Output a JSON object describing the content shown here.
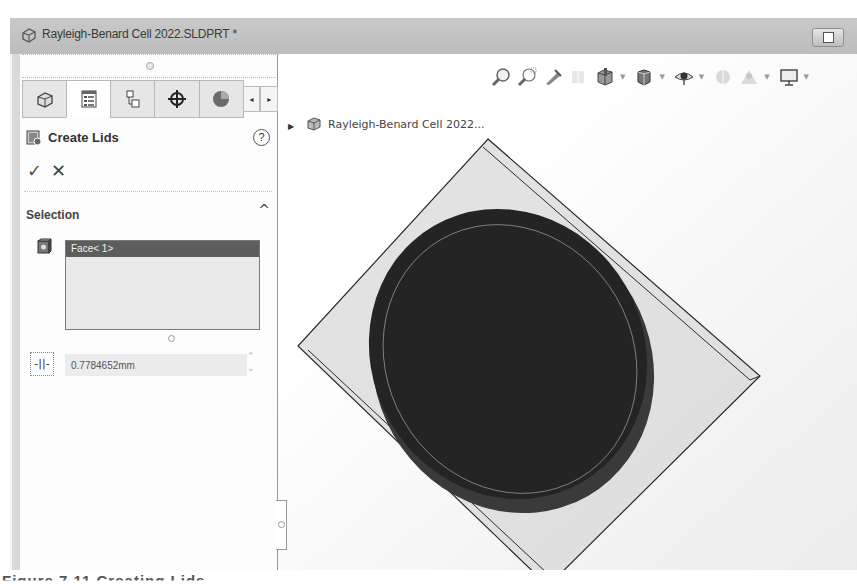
{
  "window": {
    "title": "Rayleigh-Benard Cell 2022.SLDPRT *",
    "restore_icon": "restore-window-icon"
  },
  "panel": {
    "tabs": [
      {
        "name": "feature-manager",
        "icon": "part-tree-icon",
        "active": false
      },
      {
        "name": "property-manager",
        "icon": "property-list-icon",
        "active": true
      },
      {
        "name": "configuration-manager",
        "icon": "configuration-icon",
        "active": false
      },
      {
        "name": "dimxpert-manager",
        "icon": "crosshair-icon",
        "active": false
      },
      {
        "name": "display-manager",
        "icon": "appearance-sphere-icon",
        "active": false
      }
    ],
    "tab_scroll_left": "◂",
    "tab_scroll_right": "▸",
    "property_manager": {
      "title": "Create Lids",
      "help": "?",
      "ok": "✓",
      "cancel": "✕"
    },
    "selection": {
      "title": "Selection",
      "collapse": "^",
      "items": [
        "Face< 1>"
      ],
      "thickness_value": "0.7784652mm"
    }
  },
  "viewport": {
    "heads_up_toolbar": [
      {
        "icon": "zoom-to-fit-icon",
        "dropdown": false
      },
      {
        "icon": "zoom-to-area-icon",
        "dropdown": false
      },
      {
        "icon": "previous-view-icon",
        "dropdown": false
      },
      {
        "icon": "section-view-icon",
        "dropdown": false
      },
      {
        "icon": "view-orientation-icon",
        "dropdown": true
      },
      {
        "icon": "display-style-icon",
        "dropdown": true
      },
      {
        "icon": "hide-show-items-icon",
        "dropdown": true
      },
      {
        "icon": "edit-appearance-icon",
        "dropdown": false
      },
      {
        "icon": "apply-scene-icon",
        "dropdown": true
      },
      {
        "icon": "view-settings-icon",
        "dropdown": true
      }
    ],
    "tree": {
      "expand": "▶",
      "label": "Rayleigh-Benard Cell 2022..."
    },
    "colors": {
      "disc": "#242424",
      "disc_rim": "#3a3a3a",
      "plane_fill": "#d6d6d6",
      "plane_edge": "#2a2a2a"
    }
  },
  "caption": "Figure 7.11 Creating Lids"
}
